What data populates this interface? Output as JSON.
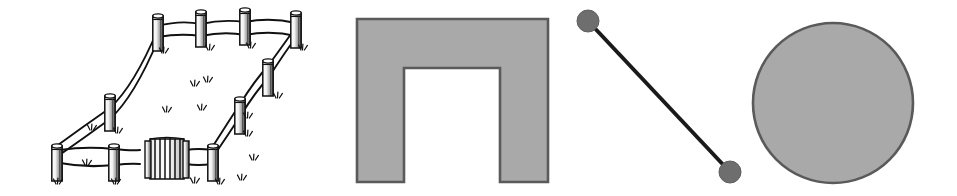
{
  "canvas": {
    "width": 957,
    "height": 196,
    "background": "#ffffff",
    "layout": "single horizontal row of four clip-art figures"
  },
  "palette": {
    "ink": "#1a1a1a",
    "outline": "#5a5a5a",
    "fill_gray": "#a9a9a9",
    "fill_gray_light": "#b5b5b5",
    "dot_gray": "#6e6e6e",
    "white": "#ffffff"
  },
  "figures": [
    {
      "id": "fence-enclosure",
      "index": 1,
      "name": "fence-enclosure-drawing",
      "label": "Fenced enclosure with gate",
      "style": "black-and-white hand-drawn line art, perspective view",
      "colors": {
        "stroke": "#1a1a1a",
        "fill": "#ffffff",
        "shading": "#8a8a8a"
      },
      "bbox": {
        "x": 40,
        "y": 10,
        "width": 290,
        "height": 175
      },
      "parts": [
        {
          "name": "corner-post-back-left",
          "x": 158,
          "y": 57
        },
        {
          "name": "post-back-row-1",
          "x": 201,
          "y": 16
        },
        {
          "name": "post-back-row-2",
          "x": 245,
          "y": 14
        },
        {
          "name": "corner-post-back-right",
          "x": 296,
          "y": 16
        },
        {
          "name": "post-left-rail-1",
          "x": 110,
          "y": 96
        },
        {
          "name": "corner-post-front-left",
          "x": 57,
          "y": 142
        },
        {
          "name": "post-front-rail-1",
          "x": 114,
          "y": 143
        },
        {
          "name": "gate-with-vertical-slats",
          "x": 152,
          "y": 138
        },
        {
          "name": "corner-post-front-right",
          "x": 212,
          "y": 140
        },
        {
          "name": "post-right-rail-1",
          "x": 240,
          "y": 99
        },
        {
          "name": "post-right-rail-2",
          "x": 268,
          "y": 62
        },
        {
          "name": "grass-tufts",
          "count": 12
        }
      ],
      "rails": 2,
      "gate": {
        "present": true,
        "slats": 7
      }
    },
    {
      "id": "arch-shape",
      "index": 2,
      "name": "arch-doorway-shape",
      "label": "Arch / inverted-U block",
      "colors": {
        "stroke": "#5a5a5a",
        "fill": "#a9a9a9"
      },
      "bbox": {
        "x": 357,
        "y": 19,
        "width": 191,
        "height": 163
      },
      "geometry": {
        "outer_left": 357,
        "outer_right": 548,
        "outer_top": 19,
        "outer_bottom": 182,
        "inner_left": 404,
        "inner_right": 500,
        "inner_top": 68,
        "inner_bottom": 182,
        "leg_width": 47,
        "lintel_height": 49
      }
    },
    {
      "id": "dumbbell-shape",
      "index": 3,
      "name": "dumbbell-bar-shape",
      "label": "Dumbbell / barbell with two end knobs",
      "colors": {
        "stroke": "#1a1a1a",
        "knob_fill": "#6e6e6e"
      },
      "bbox": {
        "x": 578,
        "y": 10,
        "width": 162,
        "height": 172
      },
      "geometry": {
        "knob_a": {
          "cx": 588,
          "cy": 21,
          "r": 11
        },
        "knob_b": {
          "cx": 730,
          "cy": 172,
          "r": 11
        },
        "bar_width": 4,
        "angle_deg": 46.7
      }
    },
    {
      "id": "circle-shape",
      "index": 4,
      "name": "filled-circle-shape",
      "label": "Gray filled circle",
      "colors": {
        "stroke": "#5a5a5a",
        "fill": "#a9a9a9"
      },
      "bbox": {
        "x": 752,
        "y": 22,
        "width": 163,
        "height": 163
      },
      "geometry": {
        "cx": 833,
        "cy": 103,
        "r": 80
      }
    }
  ]
}
